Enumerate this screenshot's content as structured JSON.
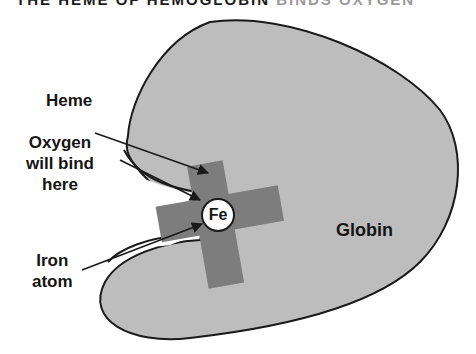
{
  "title": {
    "prefix": "THE HEME OF HEMOGLOBIN",
    "suffix": "BINDS OXYGEN"
  },
  "labels": {
    "heme": "Heme",
    "oxygen_line1": "Oxygen",
    "oxygen_line2": "will bind",
    "oxygen_line3": "here",
    "iron_line1": "Iron",
    "iron_line2": "atom",
    "fe": "Fe",
    "globin": "Globin"
  },
  "colors": {
    "globin_fill": "#bdbdbd",
    "heme_fill": "#7d7d7d",
    "outline": "#1a1a1a",
    "fe_fill": "#ffffff"
  }
}
